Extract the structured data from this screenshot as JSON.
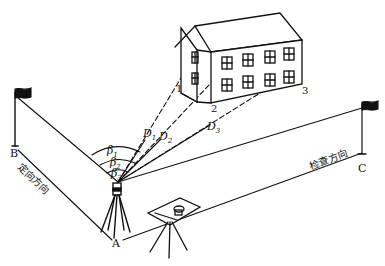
{
  "diagram": {
    "type": "surveying-setup-illustration",
    "points": {
      "A": "A",
      "B": "B",
      "C": "C"
    },
    "corners": [
      "1",
      "2",
      "3"
    ],
    "distances": [
      {
        "symbol": "D",
        "sub": "1"
      },
      {
        "symbol": "D",
        "sub": "2"
      },
      {
        "symbol": "D",
        "sub": "3"
      }
    ],
    "angles": [
      {
        "symbol": "β",
        "sub": "1"
      },
      {
        "symbol": "β",
        "sub": "2"
      },
      {
        "symbol": "β",
        "sub": "3"
      }
    ],
    "directions": {
      "orientation": "定向方向",
      "check": "检查方向"
    }
  }
}
